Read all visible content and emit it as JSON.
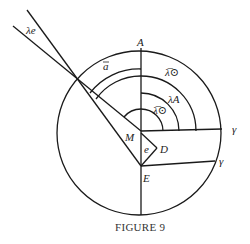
{
  "figure": {
    "caption": "FIGURE 9",
    "labels": {
      "lambda_e": "λe",
      "a_bar": "a̅",
      "A": "A",
      "lambda_sun_bar_outer": "λ̅⊙",
      "lambda_A": "λA",
      "lambda_sun_bar_inner": "λ̅⊙",
      "M": "M",
      "e": "e",
      "D": "D",
      "E": "E",
      "gamma_upper": "γ",
      "gamma_lower": "γ"
    },
    "colors": {
      "stroke": "#1a1a1a",
      "background": "#ffffff"
    }
  }
}
